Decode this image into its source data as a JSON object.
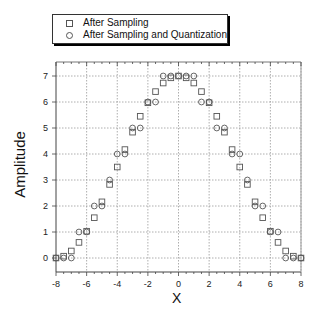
{
  "chart_data": {
    "type": "scatter",
    "title": "",
    "xlabel": "X",
    "ylabel": "Amplitude",
    "xlim": [
      -8,
      8
    ],
    "ylim": [
      -0.45,
      7.45
    ],
    "xticks": [
      -8,
      -6,
      -4,
      -2,
      0,
      2,
      4,
      6,
      8
    ],
    "yticks": [
      0,
      1,
      2,
      3,
      4,
      5,
      6,
      7
    ],
    "grid": true,
    "legend_position": "top-left, above plot",
    "series": [
      {
        "name": "After Sampling",
        "marker": "square",
        "x": [
          -8,
          -7.5,
          -7,
          -6.5,
          -6,
          -5.5,
          -5,
          -4.5,
          -4,
          -3.5,
          -3,
          -2.5,
          -2,
          -1.5,
          -1,
          -0.5,
          0,
          0.5,
          1,
          1.5,
          2,
          2.5,
          3,
          3.5,
          4,
          4.5,
          5,
          5.5,
          6,
          6.5,
          7,
          7.5,
          8
        ],
        "y": [
          0,
          0.07,
          0.27,
          0.6,
          1.03,
          1.55,
          2.16,
          2.83,
          3.5,
          4.17,
          4.84,
          5.45,
          5.97,
          6.4,
          6.73,
          6.93,
          7,
          6.93,
          6.73,
          6.4,
          5.97,
          5.45,
          4.84,
          4.17,
          3.5,
          2.83,
          2.16,
          1.55,
          1.03,
          0.6,
          0.27,
          0.07,
          0
        ]
      },
      {
        "name": "After Sampling and Quantization",
        "marker": "circle",
        "x": [
          -8,
          -7.5,
          -7,
          -6.5,
          -6,
          -5.5,
          -5,
          -4.5,
          -4,
          -3.5,
          -3,
          -2.5,
          -2,
          -1.5,
          -1,
          -0.5,
          0,
          0.5,
          1,
          1.5,
          2,
          2.5,
          3,
          3.5,
          4,
          4.5,
          5,
          5.5,
          6,
          6.5,
          7,
          7.5,
          8
        ],
        "y": [
          0,
          0,
          0,
          1,
          1,
          2,
          2,
          3,
          4,
          4,
          5,
          5,
          6,
          6,
          7,
          7,
          7,
          7,
          7,
          6,
          6,
          5,
          5,
          4,
          4,
          3,
          2,
          2,
          1,
          1,
          0,
          0,
          0
        ]
      }
    ]
  },
  "legend": {
    "items": [
      {
        "label": "After Sampling",
        "marker": "square"
      },
      {
        "label": "After Sampling and Quantization",
        "marker": "circle"
      }
    ]
  },
  "axes": {
    "xlabel": "X",
    "ylabel": "Amplitude"
  },
  "colors": {
    "marker": "#555555",
    "grid": "#999999",
    "axis": "#444444"
  }
}
